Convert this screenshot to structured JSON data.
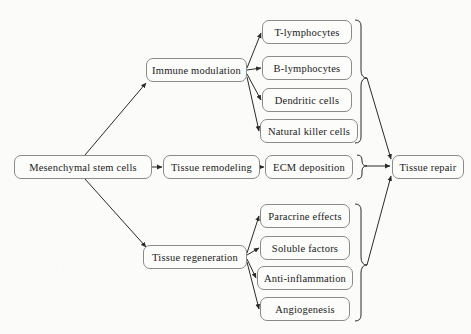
{
  "diagram": {
    "type": "flowchart",
    "style": {
      "box_border": "#8a8a8a",
      "box_fill": "#fcfcfa",
      "text_color": "#1b1b1b",
      "edge_color": "#2a2a2a",
      "page_background": "#fbfbf9"
    },
    "nodes": {
      "source": {
        "label": "Mesenchymal stem cells",
        "x": 14,
        "y": 155,
        "w": 138,
        "h": 24
      },
      "branch_immune": {
        "label": "Immune modulation",
        "x": 146,
        "y": 58,
        "w": 101,
        "h": 24
      },
      "branch_remodeling": {
        "label": "Tissue remodeling",
        "x": 163,
        "y": 155,
        "w": 97,
        "h": 24
      },
      "branch_regeneration": {
        "label": "Tissue regeneration",
        "x": 143,
        "y": 245,
        "w": 104,
        "h": 24
      },
      "ecm": {
        "label": "ECM deposition",
        "x": 265,
        "y": 155,
        "w": 88,
        "h": 24
      },
      "outcome": {
        "label": "Tissue repair",
        "x": 392,
        "y": 155,
        "w": 72,
        "h": 24
      }
    },
    "immune_targets": [
      {
        "label": "T-lymphocytes",
        "x": 262,
        "y": 20,
        "w": 90,
        "h": 24
      },
      {
        "label": "B-lymphocytes",
        "x": 262,
        "y": 56,
        "w": 90,
        "h": 24
      },
      {
        "label": "Dendritic cells",
        "x": 262,
        "y": 88,
        "w": 90,
        "h": 24
      },
      {
        "label": "Natural killer cells",
        "x": 260,
        "y": 119,
        "w": 98,
        "h": 24
      }
    ],
    "regeneration_targets": [
      {
        "label": "Paracrine effects",
        "x": 260,
        "y": 204,
        "w": 90,
        "h": 24
      },
      {
        "label": "Soluble factors",
        "x": 260,
        "y": 236,
        "w": 90,
        "h": 24
      },
      {
        "label": "Anti-inflammation",
        "x": 257,
        "y": 266,
        "w": 96,
        "h": 24
      },
      {
        "label": "Angiogenesis",
        "x": 260,
        "y": 297,
        "w": 90,
        "h": 24
      }
    ],
    "edges": [
      {
        "from": "source",
        "to": "branch_immune",
        "kind": "diagonal-up"
      },
      {
        "from": "source",
        "to": "branch_remodeling",
        "kind": "horizontal"
      },
      {
        "from": "source",
        "to": "branch_regeneration",
        "kind": "diagonal-down"
      },
      {
        "from": "branch_immune",
        "to": "T-lymphocytes",
        "kind": "fan"
      },
      {
        "from": "branch_immune",
        "to": "B-lymphocytes",
        "kind": "fan"
      },
      {
        "from": "branch_immune",
        "to": "Dendritic cells",
        "kind": "fan"
      },
      {
        "from": "branch_immune",
        "to": "Natural killer cells",
        "kind": "fan"
      },
      {
        "from": "branch_remodeling",
        "to": "ecm",
        "kind": "horizontal"
      },
      {
        "from": "branch_regeneration",
        "to": "Paracrine effects",
        "kind": "fan"
      },
      {
        "from": "branch_regeneration",
        "to": "Soluble factors",
        "kind": "fan"
      },
      {
        "from": "branch_regeneration",
        "to": "Anti-inflammation",
        "kind": "fan"
      },
      {
        "from": "branch_regeneration",
        "to": "Angiogenesis",
        "kind": "fan"
      },
      {
        "from": "immune-group-brace",
        "to": "outcome",
        "kind": "diagonal-down"
      },
      {
        "from": "ecm-brace",
        "to": "outcome",
        "kind": "horizontal"
      },
      {
        "from": "regeneration-group-brace",
        "to": "outcome",
        "kind": "diagonal-up"
      }
    ]
  }
}
